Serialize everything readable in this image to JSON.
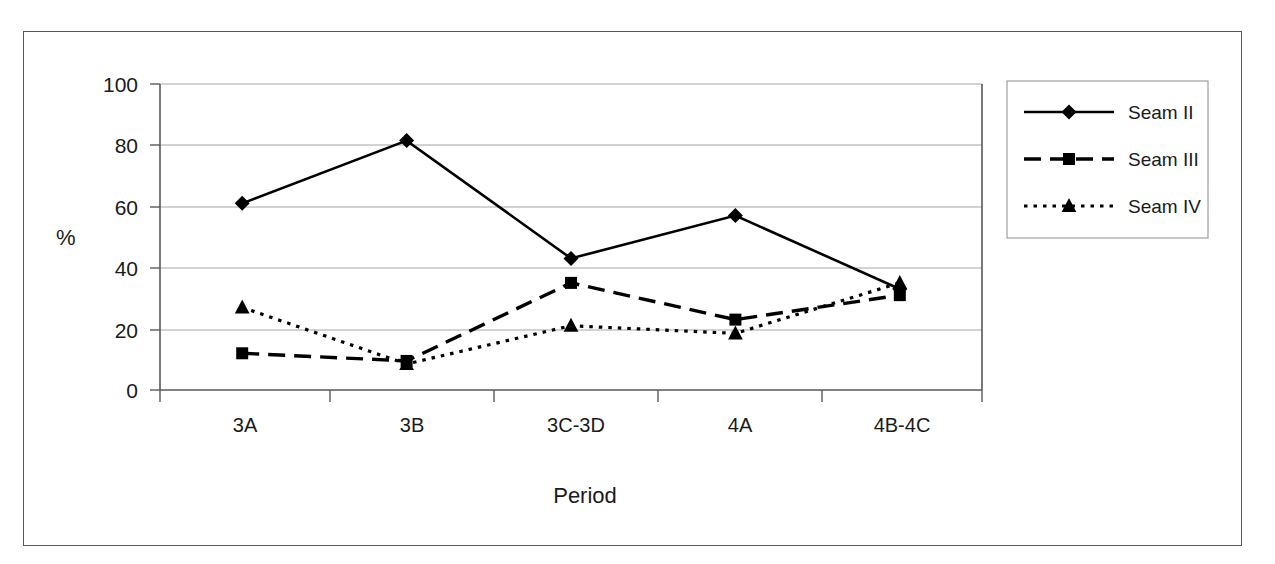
{
  "chart_data": {
    "type": "line",
    "title": "",
    "xlabel": "Period",
    "ylabel": "%",
    "categories": [
      "3A",
      "3B",
      "3C-3D",
      "4A",
      "4B-4C"
    ],
    "ylim": [
      0,
      100
    ],
    "yticks": [
      0,
      20,
      40,
      60,
      80,
      100
    ],
    "ytick_labels": [
      "0",
      "20",
      "40",
      "60",
      "80",
      "100"
    ],
    "grid": "horizontal",
    "legend_position": "right",
    "series": [
      {
        "name": "Seam II",
        "marker": "diamond",
        "linestyle": "solid",
        "color": "#000000",
        "values": [
          61,
          81.5,
          43,
          57,
          33
        ]
      },
      {
        "name": "Seam III",
        "marker": "square",
        "linestyle": "dashed",
        "color": "#000000",
        "values": [
          12,
          9.5,
          35,
          23,
          31
        ]
      },
      {
        "name": "Seam IV",
        "marker": "triangle",
        "linestyle": "dotted",
        "color": "#000000",
        "values": [
          27,
          8.5,
          21,
          18.5,
          35
        ]
      }
    ]
  },
  "axes": {
    "y_label": "%",
    "x_label": "Period",
    "y_tick_0": "0",
    "y_tick_20": "20",
    "y_tick_40": "40",
    "y_tick_60": "60",
    "y_tick_80": "80",
    "y_tick_100": "100",
    "x_cat_0": "3A",
    "x_cat_1": "3B",
    "x_cat_2": "3C-3D",
    "x_cat_3": "4A",
    "x_cat_4": "4B-4C"
  },
  "legend": {
    "entries": [
      {
        "label": "Seam II"
      },
      {
        "label": "Seam III"
      },
      {
        "label": "Seam IV"
      }
    ],
    "item_0_label": "Seam II",
    "item_1_label": "Seam III",
    "item_2_label": "Seam IV"
  }
}
